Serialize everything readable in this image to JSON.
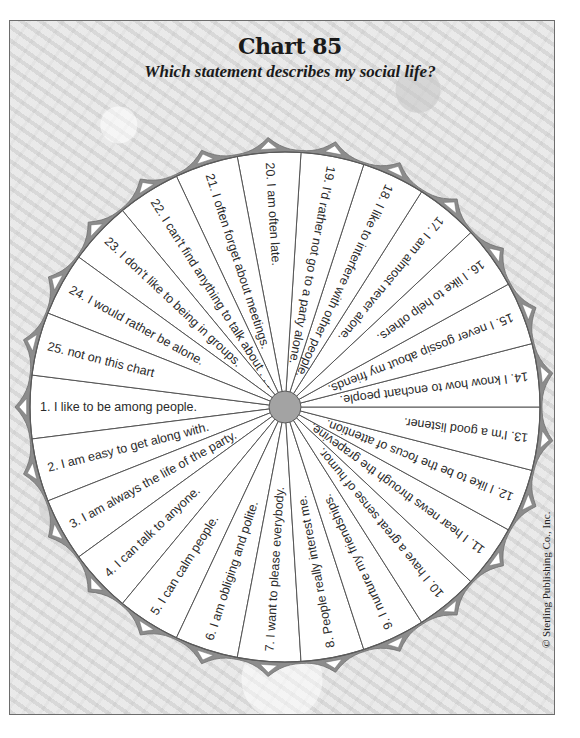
{
  "header": {
    "title": "Chart 85",
    "subtitle": "Which statement describes my social life?"
  },
  "footer": {
    "copyright": "© Sterling Publishing Co., Inc."
  },
  "colors": {
    "rim": "#8c8c8c",
    "divider": "#555555",
    "wedge_fill": "#ffffff",
    "hub": "#a3a3a3",
    "pointer_inner": "#ffffff"
  },
  "wheel": {
    "center_x": 285,
    "center_y": 407,
    "radius": 255,
    "hub_radius": 16,
    "segment_count": 25,
    "first_segment_center_deg": 180,
    "direction": "counterclockwise-from-left-via-bottom",
    "segments": [
      {
        "number": 1,
        "text": "1.  I like to be among people."
      },
      {
        "number": 2,
        "text": "2.  I am easy to get along with."
      },
      {
        "number": 3,
        "text": "3.  I am always the life of the party."
      },
      {
        "number": 4,
        "text": "4.  I can talk to anyone."
      },
      {
        "number": 5,
        "text": "5.  I can calm people."
      },
      {
        "number": 6,
        "text": "6.  I am obliging and polite."
      },
      {
        "number": 7,
        "text": "7.  I want to please everybody."
      },
      {
        "number": 8,
        "text": "8.  People really interest me."
      },
      {
        "number": 9,
        "text": "9.  I nurture my friendships."
      },
      {
        "number": 10,
        "text": "10.  I have a great sense of humor."
      },
      {
        "number": 11,
        "text": "11.  I hear news through the grapevine."
      },
      {
        "number": 12,
        "text": "12.  I like to be the focus of attention."
      },
      {
        "number": 13,
        "text": "13.  I'm a good listener."
      },
      {
        "number": 14,
        "text": "14.  I know how to enchant people."
      },
      {
        "number": 15,
        "text": "15.  I never gossip about my friends."
      },
      {
        "number": 16,
        "text": "16.  I like to help others."
      },
      {
        "number": 17,
        "text": "17.  I am almost never alone."
      },
      {
        "number": 18,
        "text": "18.  I like to interfere with other people."
      },
      {
        "number": 19,
        "text": "19.  I'd rather not go to a party alone."
      },
      {
        "number": 20,
        "text": "20.  I am often late."
      },
      {
        "number": 21,
        "text": "21.  I often forget about meetings."
      },
      {
        "number": 22,
        "text": "22.  I can't find anything to talk about . . ."
      },
      {
        "number": 23,
        "text": "23.  I don't like to being in groups."
      },
      {
        "number": 24,
        "text": "24.  I would rather be alone."
      },
      {
        "number": 25,
        "text": "25.  not on this chart"
      }
    ]
  }
}
